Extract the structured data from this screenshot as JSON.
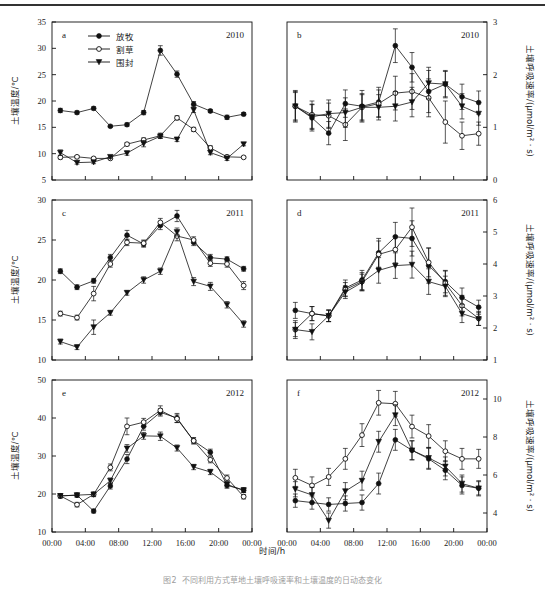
{
  "figure": {
    "xlabel": "时间/h",
    "caption": "图2  不同利用方式草地土壤呼吸速率和土壤温度的日动态变化",
    "legend": [
      {
        "label": "放牧",
        "marker": "filled-circle"
      },
      {
        "label": "割草",
        "marker": "open-circle"
      },
      {
        "label": "围封",
        "marker": "filled-triangle-down"
      }
    ],
    "xticks": [
      "00:00",
      "04:00",
      "08:00",
      "12:00",
      "16:00",
      "20:00",
      "00:00"
    ],
    "color_line": "#111111",
    "color_marker_fill": "#111111",
    "color_open_fill": "#ffffff"
  },
  "chart_data": [
    {
      "id": "a",
      "type": "line",
      "panel_label": "a",
      "year": "2010",
      "title": "",
      "xlabel": "时间/h",
      "ylabel": "土壤温度/℃",
      "ylim": [
        5,
        35
      ],
      "yticks": [
        5,
        10,
        15,
        20,
        25,
        30,
        35
      ],
      "xlim": [
        0,
        24
      ],
      "x": [
        1,
        3,
        5,
        7,
        9,
        11,
        13,
        15,
        17,
        19,
        21,
        23
      ],
      "grid": false,
      "legend_position": "top-left",
      "series": [
        {
          "name": "放牧",
          "marker": "filled-circle",
          "values": [
            18.2,
            17.8,
            18.6,
            15.2,
            15.5,
            17.8,
            29.6,
            25.1,
            19.4,
            18.1,
            16.9,
            17.5
          ],
          "err": [
            0.4,
            0.3,
            0.3,
            0.2,
            0.3,
            0.4,
            0.9,
            0.6,
            0.5,
            0.3,
            0.4,
            0.3
          ]
        },
        {
          "name": "割草",
          "marker": "open-circle",
          "values": [
            9.3,
            9.4,
            9.1,
            9.1,
            11.8,
            12.6,
            13.4,
            16.8,
            14.6,
            11.1,
            9.4,
            9.3
          ],
          "err": [
            0.3,
            0.2,
            0.2,
            0.2,
            0.3,
            0.4,
            0.5,
            0.4,
            0.4,
            0.4,
            0.3,
            0.2
          ]
        },
        {
          "name": "围封",
          "marker": "filled-triangle-down",
          "values": [
            10.2,
            8.3,
            8.4,
            9.4,
            10.1,
            11.9,
            13.3,
            12.7,
            18.3,
            10.2,
            9.1,
            11.8
          ],
          "err": [
            0.5,
            0.3,
            0.3,
            0.3,
            0.4,
            0.6,
            0.4,
            0.4,
            0.5,
            0.4,
            0.4,
            0.3
          ]
        }
      ]
    },
    {
      "id": "b",
      "type": "line",
      "panel_label": "b",
      "year": "2010",
      "xlabel": "时间/h",
      "ylabel": "土壤呼吸速率/(μmol/m² · s)",
      "ylim": [
        0,
        3
      ],
      "yticks": [
        0,
        1,
        2,
        3
      ],
      "xlim": [
        0,
        24
      ],
      "x": [
        1,
        3,
        5,
        7,
        9,
        11,
        13,
        15,
        17,
        19,
        21,
        23
      ],
      "grid": false,
      "series": [
        {
          "name": "放牧",
          "marker": "filled-circle",
          "values": [
            1.4,
            1.18,
            0.89,
            1.45,
            1.4,
            1.48,
            2.55,
            2.14,
            1.68,
            1.82,
            1.58,
            1.47
          ],
          "err": [
            0.3,
            0.25,
            0.22,
            0.26,
            0.3,
            0.28,
            0.32,
            0.28,
            0.4,
            0.26,
            0.24,
            0.22
          ]
        },
        {
          "name": "割草",
          "marker": "open-circle",
          "values": [
            1.4,
            1.24,
            1.22,
            1.05,
            1.38,
            1.45,
            1.65,
            1.68,
            1.56,
            1.1,
            0.84,
            0.88
          ],
          "err": [
            0.28,
            0.26,
            0.24,
            0.3,
            0.26,
            0.26,
            0.32,
            0.34,
            0.36,
            0.4,
            0.26,
            0.22
          ]
        },
        {
          "name": "围封",
          "marker": "filled-triangle-down",
          "values": [
            1.4,
            1.2,
            1.26,
            1.28,
            1.38,
            1.38,
            1.4,
            1.48,
            1.84,
            1.82,
            1.4,
            1.26
          ],
          "err": [
            0.26,
            0.24,
            0.26,
            0.28,
            0.24,
            0.24,
            0.28,
            0.28,
            0.3,
            0.24,
            0.24,
            0.22
          ]
        }
      ]
    },
    {
      "id": "c",
      "type": "line",
      "panel_label": "c",
      "year": "2011",
      "xlabel": "时间/h",
      "ylabel": "土壤温度/℃",
      "ylim": [
        10,
        30
      ],
      "yticks": [
        10,
        15,
        20,
        25,
        30
      ],
      "xlim": [
        0,
        24
      ],
      "x": [
        1,
        3,
        5,
        7,
        9,
        11,
        13,
        15,
        17,
        19,
        21,
        23
      ],
      "grid": false,
      "series": [
        {
          "name": "放牧",
          "marker": "filled-circle",
          "values": [
            21.1,
            19.1,
            19.9,
            22.8,
            25.6,
            24.5,
            26.8,
            28.0,
            24.7,
            22.8,
            22.6,
            21.4
          ],
          "err": [
            0.3,
            0.3,
            0.3,
            0.4,
            0.6,
            0.4,
            0.5,
            0.7,
            0.4,
            0.4,
            0.3,
            0.3
          ]
        },
        {
          "name": "割草",
          "marker": "open-circle",
          "values": [
            15.8,
            15.3,
            18.3,
            22.0,
            24.7,
            24.6,
            27.2,
            25.5,
            25.0,
            22.1,
            22.0,
            19.3
          ],
          "err": [
            0.3,
            0.3,
            0.9,
            0.4,
            0.4,
            0.4,
            0.5,
            0.6,
            0.4,
            0.4,
            0.4,
            0.5
          ]
        },
        {
          "name": "围封",
          "marker": "filled-triangle-down",
          "values": [
            12.3,
            11.6,
            14.1,
            15.9,
            18.4,
            20.0,
            21.1,
            26.0,
            19.8,
            19.2,
            16.9,
            14.5
          ],
          "err": [
            0.3,
            0.3,
            0.9,
            0.3,
            0.3,
            0.4,
            0.4,
            0.5,
            0.5,
            0.5,
            0.4,
            0.4
          ]
        }
      ]
    },
    {
      "id": "d",
      "type": "line",
      "panel_label": "d",
      "year": "2011",
      "xlabel": "时间/h",
      "ylabel": "土壤呼吸速率/(μmol/m² · s)",
      "ylim": [
        1,
        6
      ],
      "yticks": [
        1,
        2,
        3,
        4,
        5,
        6
      ],
      "xlim": [
        0,
        24
      ],
      "x": [
        1,
        3,
        5,
        7,
        9,
        11,
        13,
        15,
        17,
        19,
        21,
        23
      ],
      "grid": false,
      "series": [
        {
          "name": "放牧",
          "marker": "filled-circle",
          "values": [
            2.55,
            2.45,
            2.38,
            3.25,
            3.5,
            4.35,
            4.85,
            4.8,
            3.95,
            3.45,
            2.95,
            2.65
          ],
          "err": [
            0.25,
            0.22,
            0.18,
            0.25,
            0.3,
            0.45,
            0.45,
            0.55,
            0.55,
            0.35,
            0.3,
            0.22
          ]
        },
        {
          "name": "割草",
          "marker": "open-circle",
          "values": [
            1.95,
            2.45,
            2.38,
            3.2,
            3.45,
            4.3,
            4.45,
            5.15,
            4.05,
            3.4,
            2.7,
            2.3
          ],
          "err": [
            0.28,
            0.22,
            0.18,
            0.22,
            0.28,
            0.42,
            0.42,
            0.6,
            0.45,
            0.38,
            0.32,
            0.22
          ]
        },
        {
          "name": "围封",
          "marker": "filled-triangle-down",
          "values": [
            1.95,
            1.88,
            2.38,
            3.12,
            3.42,
            3.8,
            3.95,
            3.98,
            3.45,
            3.3,
            2.45,
            2.28
          ],
          "err": [
            0.22,
            0.25,
            0.18,
            0.2,
            0.26,
            0.4,
            0.4,
            0.42,
            0.4,
            0.32,
            0.28,
            0.2
          ]
        }
      ]
    },
    {
      "id": "e",
      "type": "line",
      "panel_label": "e",
      "year": "2012",
      "xlabel": "时间/h",
      "ylabel": "土壤温度/℃",
      "ylim": [
        10,
        50
      ],
      "yticks": [
        10,
        20,
        30,
        40,
        50
      ],
      "xlim": [
        0,
        24
      ],
      "x": [
        1,
        3,
        5,
        7,
        9,
        11,
        13,
        15,
        17,
        19,
        21,
        23
      ],
      "grid": false,
      "series": [
        {
          "name": "放牧",
          "marker": "filled-circle",
          "values": [
            19.5,
            19.7,
            15.5,
            22.1,
            29.2,
            37.8,
            41.5,
            40.0,
            34.0,
            31.0,
            22.3,
            21.0
          ],
          "err": [
            0.5,
            0.5,
            0.5,
            0.8,
            1.2,
            1.0,
            1.0,
            1.2,
            0.8,
            0.8,
            0.8,
            0.6
          ]
        },
        {
          "name": "割草",
          "marker": "open-circle",
          "values": [
            19.5,
            17.2,
            19.9,
            27.0,
            37.8,
            38.9,
            42.0,
            39.8,
            34.0,
            29.0,
            24.2,
            19.3
          ],
          "err": [
            0.5,
            0.6,
            0.6,
            0.9,
            2.2,
            1.0,
            1.2,
            1.0,
            0.8,
            0.8,
            0.8,
            0.6
          ]
        },
        {
          "name": "围封",
          "marker": "filled-triangle-down",
          "values": [
            19.5,
            19.7,
            19.9,
            23.5,
            32.0,
            35.3,
            35.2,
            32.1,
            27.1,
            25.8,
            22.5,
            21.0
          ],
          "err": [
            0.5,
            0.5,
            0.5,
            0.7,
            1.0,
            0.9,
            1.1,
            0.8,
            0.7,
            0.7,
            0.7,
            0.6
          ]
        }
      ]
    },
    {
      "id": "f",
      "type": "line",
      "panel_label": "f",
      "year": "2012",
      "xlabel": "时间/h",
      "ylabel": "土壤呼吸速率/(μmol/m² · s)",
      "ylim": [
        3,
        11
      ],
      "yticks": [
        4,
        6,
        8,
        10
      ],
      "xlim": [
        0,
        24
      ],
      "x": [
        1,
        3,
        5,
        7,
        9,
        11,
        13,
        15,
        17,
        19,
        21,
        23
      ],
      "grid": false,
      "series": [
        {
          "name": "放牧",
          "marker": "filled-circle",
          "values": [
            4.65,
            4.55,
            4.45,
            4.5,
            4.55,
            5.55,
            7.85,
            7.3,
            6.85,
            6.25,
            5.45,
            5.3
          ],
          "err": [
            0.35,
            0.35,
            0.35,
            0.4,
            0.4,
            0.55,
            0.55,
            0.5,
            0.55,
            0.5,
            0.45,
            0.35
          ]
        },
        {
          "name": "割草",
          "marker": "open-circle",
          "values": [
            5.85,
            5.45,
            5.9,
            6.85,
            8.1,
            9.8,
            9.75,
            8.55,
            8.05,
            7.25,
            6.85,
            6.85
          ],
          "err": [
            0.45,
            0.45,
            0.45,
            0.55,
            0.6,
            0.65,
            0.65,
            0.6,
            0.6,
            0.55,
            0.55,
            0.5
          ]
        },
        {
          "name": "围封",
          "marker": "filled-triangle-down",
          "values": [
            5.25,
            4.95,
            3.6,
            5.15,
            5.7,
            7.75,
            9.15,
            7.3,
            6.9,
            6.45,
            5.55,
            5.3
          ],
          "err": [
            0.4,
            0.4,
            0.4,
            0.45,
            0.5,
            0.55,
            0.55,
            0.5,
            0.55,
            0.5,
            0.45,
            0.4
          ]
        }
      ]
    }
  ]
}
